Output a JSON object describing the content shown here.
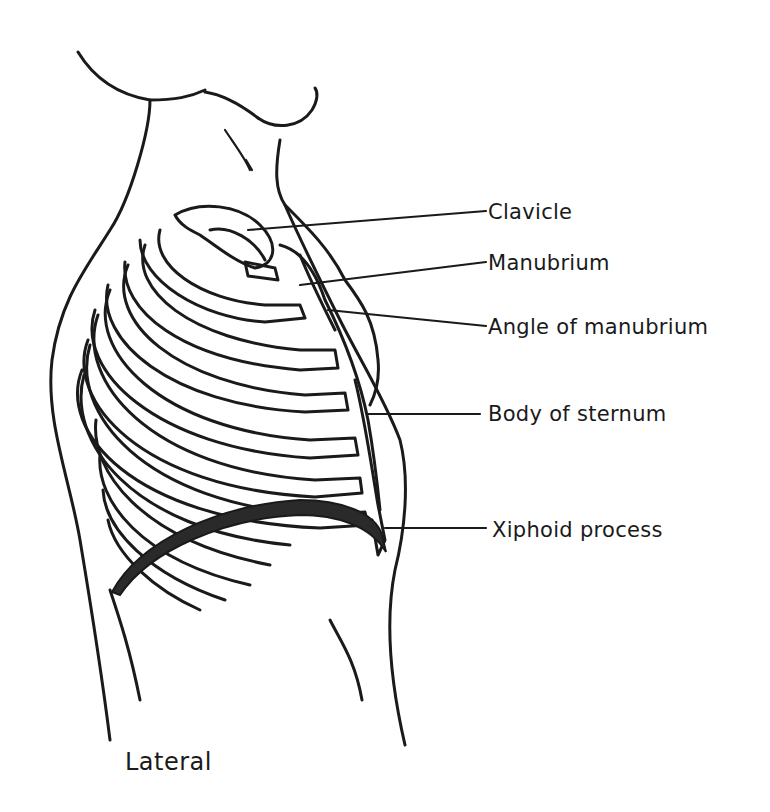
{
  "diagram": {
    "caption": "Lateral",
    "labels": [
      {
        "id": "clavicle",
        "text": "Clavicle"
      },
      {
        "id": "manubrium",
        "text": "Manubrium"
      },
      {
        "id": "angle",
        "text": "Angle of manubrium"
      },
      {
        "id": "body",
        "text": "Body of sternum"
      },
      {
        "id": "xiphoid",
        "text": "Xiphoid process"
      }
    ],
    "colors": {
      "ink": "#1a1a1a",
      "background": "#ffffff"
    }
  }
}
